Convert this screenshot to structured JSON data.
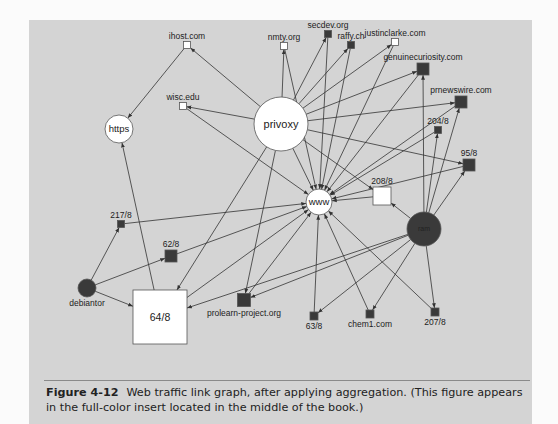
{
  "figure": {
    "number": "Figure 4-12",
    "caption": "Web traffic link graph, after applying aggregation. (This figure appears in the full-color insert located in the middle of the book.)"
  },
  "colors": {
    "panel_bg": "#d4d4d4",
    "node_dark": "#3a3a3a",
    "node_light": "#ffffff",
    "edge": "#333333"
  },
  "graph": {
    "nodes": [
      {
        "id": "privoxy",
        "label": "privoxy",
        "shape": "circle",
        "fill": "light",
        "x": 281,
        "y": 124,
        "r": 27,
        "label_pos": "center",
        "font": 11
      },
      {
        "id": "https",
        "label": "https",
        "shape": "circle",
        "fill": "light",
        "x": 119,
        "y": 129,
        "r": 14,
        "label_pos": "center",
        "font": 9.5
      },
      {
        "id": "www",
        "label": "www",
        "shape": "circle",
        "fill": "light",
        "x": 319,
        "y": 202,
        "r": 13,
        "label_pos": "center",
        "font": 9.5
      },
      {
        "id": "ram",
        "label": "ram",
        "shape": "circle",
        "fill": "dark",
        "x": 424,
        "y": 229,
        "r": 17,
        "label_pos": "center",
        "font": 7
      },
      {
        "id": "debiantor",
        "label": "debiantor",
        "shape": "circle",
        "fill": "dark",
        "x": 87,
        "y": 288,
        "r": 9,
        "label_pos": "below",
        "font": 8.5
      },
      {
        "id": "ihost",
        "label": "ihost.com",
        "shape": "square",
        "fill": "light",
        "x": 187,
        "y": 45,
        "s": 7,
        "label_pos": "above"
      },
      {
        "id": "wisc",
        "label": "wisc.edu",
        "shape": "square",
        "fill": "light",
        "x": 183,
        "y": 106,
        "s": 7,
        "label_pos": "above"
      },
      {
        "id": "nmty",
        "label": "nmty.org",
        "shape": "square",
        "fill": "light",
        "x": 284,
        "y": 46,
        "s": 7,
        "label_pos": "above"
      },
      {
        "id": "secdev",
        "label": "secdev.org",
        "shape": "square",
        "fill": "dark",
        "x": 328,
        "y": 34,
        "s": 7,
        "label_pos": "above"
      },
      {
        "id": "raffy",
        "label": "raffy.ch",
        "shape": "square",
        "fill": "dark",
        "x": 351,
        "y": 45,
        "s": 7,
        "label_pos": "above"
      },
      {
        "id": "justinclarke",
        "label": "justinclarke.com",
        "shape": "square",
        "fill": "light",
        "x": 395,
        "y": 42,
        "s": 7,
        "label_pos": "above"
      },
      {
        "id": "genuinecuriosity",
        "label": "genuinecuriosity.com",
        "shape": "square",
        "fill": "dark",
        "x": 423,
        "y": 69,
        "s": 12,
        "label_pos": "above"
      },
      {
        "id": "prnewswire",
        "label": "prnewswire.com",
        "shape": "square",
        "fill": "dark",
        "x": 461,
        "y": 102,
        "s": 12,
        "label_pos": "above"
      },
      {
        "id": "n204",
        "label": "204/8",
        "shape": "square",
        "fill": "dark",
        "x": 438,
        "y": 130,
        "s": 7,
        "label_pos": "above"
      },
      {
        "id": "n95",
        "label": "95/8",
        "shape": "square",
        "fill": "dark",
        "x": 469,
        "y": 165,
        "s": 12,
        "label_pos": "above"
      },
      {
        "id": "n208",
        "label": "208/8",
        "shape": "square",
        "fill": "light",
        "x": 382,
        "y": 196,
        "s": 18,
        "label_pos": "above"
      },
      {
        "id": "n217",
        "label": "217/8",
        "shape": "square",
        "fill": "dark",
        "x": 121,
        "y": 224,
        "s": 7,
        "label_pos": "above"
      },
      {
        "id": "n62",
        "label": "62/8",
        "shape": "square",
        "fill": "dark",
        "x": 171,
        "y": 256,
        "s": 12,
        "label_pos": "above"
      },
      {
        "id": "n64",
        "label": "64/8",
        "shape": "square",
        "fill": "light",
        "x": 160,
        "y": 317,
        "s": 54,
        "label_pos": "center",
        "font": 10.5
      },
      {
        "id": "prolearn",
        "label": "prolearn-project.org",
        "shape": "square",
        "fill": "dark",
        "x": 244,
        "y": 300,
        "s": 13,
        "label_pos": "below"
      },
      {
        "id": "n63",
        "label": "63/8",
        "shape": "square",
        "fill": "dark",
        "x": 314,
        "y": 316,
        "s": 8,
        "label_pos": "below"
      },
      {
        "id": "chem1",
        "label": "chem1.com",
        "shape": "square",
        "fill": "dark",
        "x": 370,
        "y": 314,
        "s": 8,
        "label_pos": "below"
      },
      {
        "id": "n207",
        "label": "207/8",
        "shape": "square",
        "fill": "dark",
        "x": 435,
        "y": 312,
        "s": 8,
        "label_pos": "below"
      }
    ],
    "edges": [
      [
        "privoxy",
        "ihost"
      ],
      [
        "privoxy",
        "wisc"
      ],
      [
        "privoxy",
        "nmty"
      ],
      [
        "privoxy",
        "secdev"
      ],
      [
        "privoxy",
        "raffy"
      ],
      [
        "privoxy",
        "justinclarke"
      ],
      [
        "privoxy",
        "genuinecuriosity"
      ],
      [
        "privoxy",
        "prnewswire"
      ],
      [
        "privoxy",
        "n95"
      ],
      [
        "privoxy",
        "www"
      ],
      [
        "privoxy",
        "n208"
      ],
      [
        "privoxy",
        "n64"
      ],
      [
        "privoxy",
        "prolearn"
      ],
      [
        "ihost",
        "https"
      ],
      [
        "n64",
        "https"
      ],
      [
        "nmty",
        "www"
      ],
      [
        "secdev",
        "www"
      ],
      [
        "raffy",
        "www"
      ],
      [
        "justinclarke",
        "www"
      ],
      [
        "genuinecuriosity",
        "www"
      ],
      [
        "prnewswire",
        "www"
      ],
      [
        "n204",
        "www"
      ],
      [
        "n95",
        "www"
      ],
      [
        "n208",
        "www"
      ],
      [
        "n217",
        "www"
      ],
      [
        "n62",
        "www"
      ],
      [
        "n64",
        "www"
      ],
      [
        "prolearn",
        "www"
      ],
      [
        "n63",
        "www"
      ],
      [
        "chem1",
        "www"
      ],
      [
        "n207",
        "www"
      ],
      [
        "wisc",
        "www"
      ],
      [
        "ram",
        "genuinecuriosity"
      ],
      [
        "ram",
        "prnewswire"
      ],
      [
        "ram",
        "n204"
      ],
      [
        "ram",
        "n95"
      ],
      [
        "ram",
        "n208"
      ],
      [
        "ram",
        "n64"
      ],
      [
        "ram",
        "prolearn"
      ],
      [
        "ram",
        "n63"
      ],
      [
        "ram",
        "chem1"
      ],
      [
        "ram",
        "n207"
      ],
      [
        "debiantor",
        "n217"
      ],
      [
        "debiantor",
        "n62"
      ],
      [
        "debiantor",
        "n64"
      ]
    ]
  }
}
